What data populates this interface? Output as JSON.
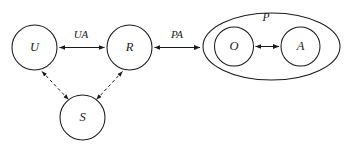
{
  "diagram": {
    "type": "node-link-graph",
    "background_color": "#ffffff",
    "stroke_color": "#1a1a1a",
    "nodes": [
      {
        "id": "U",
        "label": "U",
        "shape": "circle",
        "cx": 34.5,
        "cy": 47.5,
        "r": 22.5
      },
      {
        "id": "R",
        "label": "R",
        "shape": "circle",
        "cx": 129.5,
        "cy": 47.5,
        "r": 22.5
      },
      {
        "id": "S",
        "label": "S",
        "shape": "circle",
        "cx": 82.5,
        "cy": 117.5,
        "r": 22.5
      },
      {
        "id": "O",
        "label": "O",
        "shape": "circle",
        "cx": 234.0,
        "cy": 46.5,
        "r": 19.5
      },
      {
        "id": "A",
        "label": "A",
        "shape": "circle",
        "cx": 300.5,
        "cy": 46.5,
        "r": 19.5
      }
    ],
    "groups": [
      {
        "id": "P",
        "label": "P",
        "shape": "ellipse",
        "cx": 271.5,
        "cy": 46.5,
        "rx": 68.5,
        "ry": 33.5,
        "label_x": 266.0,
        "label_y": 18.5,
        "contains": [
          "O",
          "A"
        ]
      }
    ],
    "edges": [
      {
        "id": "UA",
        "from": "U",
        "to": "R",
        "label": "UA",
        "style": "solid",
        "arrows": "both",
        "label_x": 81.0,
        "label_y": 35.0
      },
      {
        "id": "PA",
        "from": "R",
        "to": "P",
        "label": "PA",
        "style": "solid",
        "arrows": "both",
        "label_x": 177.0,
        "label_y": 35.0
      },
      {
        "id": "US",
        "from": "U",
        "to": "S",
        "label": "",
        "style": "dashed",
        "arrows": "both",
        "label_x": 0,
        "label_y": 0
      },
      {
        "id": "SR",
        "from": "S",
        "to": "R",
        "label": "",
        "style": "dashed",
        "arrows": "both",
        "label_x": 0,
        "label_y": 0
      },
      {
        "id": "OA",
        "from": "O",
        "to": "A",
        "label": "",
        "style": "solid",
        "arrows": "both",
        "label_x": 0,
        "label_y": 0
      }
    ]
  }
}
